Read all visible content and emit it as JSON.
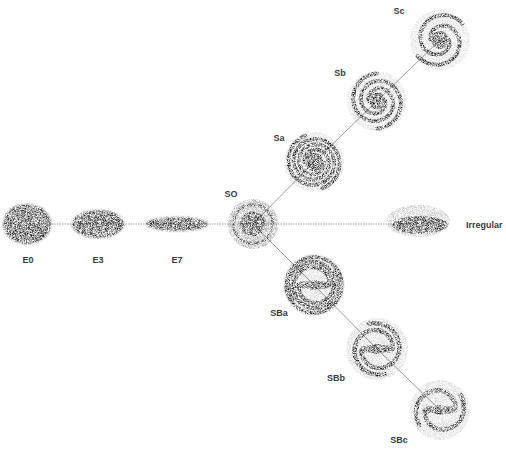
{
  "colors": {
    "background": "#ffffff",
    "ink": "#111111",
    "connector": "#9a9a9a",
    "label": "#3a3a3a"
  },
  "branches": {
    "elliptical": [
      "E0",
      "E3",
      "E7"
    ],
    "lenticular": [
      "SO"
    ],
    "spiral": [
      "Sa",
      "Sb",
      "Sc"
    ],
    "barred_spiral": [
      "SBa",
      "SBb",
      "SBc"
    ],
    "irregular": [
      "Irregular"
    ]
  },
  "nodes": [
    {
      "id": "E0",
      "label": "E0",
      "type": "elliptical",
      "cx": 27,
      "cy": 224,
      "rx": 23,
      "ry": 19,
      "label_x": 28,
      "label_y": 260
    },
    {
      "id": "E3",
      "label": "E3",
      "type": "elliptical",
      "cx": 98,
      "cy": 224,
      "rx": 25,
      "ry": 13,
      "label_x": 98,
      "label_y": 260
    },
    {
      "id": "E7",
      "label": "E7",
      "type": "elliptical",
      "cx": 177,
      "cy": 224,
      "rx": 30,
      "ry": 6,
      "label_x": 177,
      "label_y": 260
    },
    {
      "id": "S0",
      "label": "SO",
      "type": "lenticular",
      "cx": 253,
      "cy": 224,
      "r": 25,
      "label_x": 231,
      "label_y": 194
    },
    {
      "id": "Sa",
      "label": "Sa",
      "type": "spiral",
      "cx": 314,
      "cy": 162,
      "r": 30,
      "label_x": 279,
      "label_y": 138
    },
    {
      "id": "Sb",
      "label": "Sb",
      "type": "spiral",
      "cx": 377,
      "cy": 101,
      "r": 30,
      "label_x": 340,
      "label_y": 73
    },
    {
      "id": "Sc",
      "label": "Sc",
      "type": "spiral",
      "cx": 440,
      "cy": 40,
      "r": 30,
      "label_x": 399,
      "label_y": 11
    },
    {
      "id": "SBa",
      "label": "SBa",
      "type": "barred_spiral",
      "cx": 314,
      "cy": 285,
      "r": 31,
      "label_x": 279,
      "label_y": 313
    },
    {
      "id": "SBb",
      "label": "SBb",
      "type": "barred_spiral",
      "cx": 377,
      "cy": 349,
      "r": 31,
      "label_x": 336,
      "label_y": 378
    },
    {
      "id": "SBc",
      "label": "SBc",
      "type": "barred_spiral",
      "cx": 440,
      "cy": 410,
      "r": 30,
      "label_x": 399,
      "label_y": 440
    },
    {
      "id": "Irr",
      "label": "Irregular",
      "type": "irregular",
      "cx": 418,
      "cy": 224,
      "rx": 32,
      "ry": 12,
      "label_x": 466,
      "label_y": 225
    }
  ],
  "edges": [
    {
      "from": "E0",
      "to": "E3"
    },
    {
      "from": "E3",
      "to": "E7"
    },
    {
      "from": "E7",
      "to": "S0"
    },
    {
      "from": "S0",
      "to": "Irr"
    },
    {
      "from": "S0",
      "to": "Sa"
    },
    {
      "from": "Sa",
      "to": "Sb"
    },
    {
      "from": "Sb",
      "to": "Sc"
    },
    {
      "from": "S0",
      "to": "SBa"
    },
    {
      "from": "SBa",
      "to": "SBb"
    },
    {
      "from": "SBb",
      "to": "SBc"
    }
  ]
}
